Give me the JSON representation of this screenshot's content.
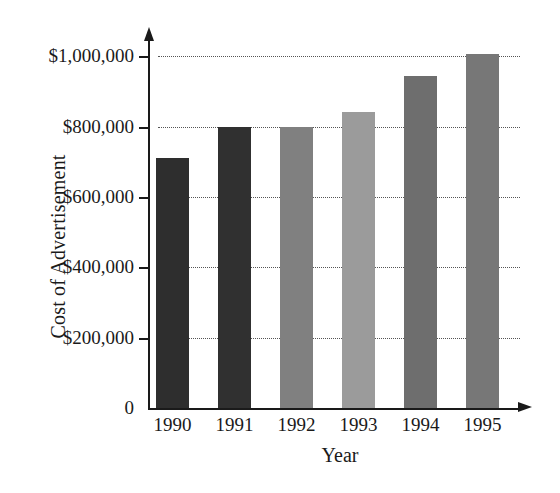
{
  "chart_data": {
    "type": "bar",
    "title": "",
    "xlabel": "Year",
    "ylabel": "Cost of Advertisement",
    "categories": [
      "1990",
      "1991",
      "1992",
      "1993",
      "1994",
      "1995"
    ],
    "values": [
      710000,
      800000,
      800000,
      840000,
      945000,
      1005000
    ],
    "value_labels": [
      "$710,000",
      "$800,000",
      "$800,000",
      "$840,000",
      "$945,000",
      "$1,005,000"
    ],
    "series": [
      {
        "name": "Cost of Advertisement",
        "values": [
          710000,
          800000,
          800000,
          840000,
          945000,
          1005000
        ]
      }
    ],
    "bar_colors": [
      "#2e2e2e",
      "#303030",
      "#808080",
      "#9b9b9b",
      "#6e6e6e",
      "#777777"
    ],
    "ylim": [
      0,
      1080000
    ],
    "ytick_values": [
      0,
      200000,
      400000,
      600000,
      800000,
      1000000
    ],
    "ytick_labels": [
      "0",
      "$200,000",
      "$400,000",
      "$600,000",
      "$800,000",
      "$1,000,000"
    ],
    "grid": true,
    "grid_style": "dotted",
    "grid_axis": "y",
    "legend": "none",
    "axis_arrows": true,
    "background_color": "#ffffff",
    "axis_color": "#1a1a1a"
  }
}
